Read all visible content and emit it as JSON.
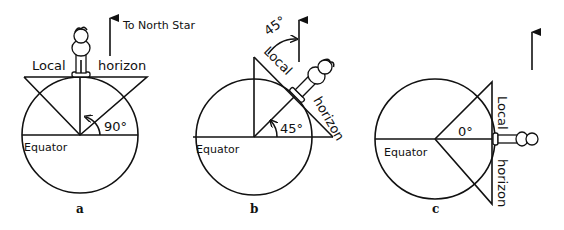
{
  "panels": [
    {
      "id": "a",
      "caption": "a",
      "local_label": "Local",
      "horizon_label": "horizon",
      "equator_label": "Equator",
      "angle_label": "90°",
      "arrow_label": "To North Star"
    },
    {
      "id": "b",
      "caption": "b",
      "local_label": "Local",
      "horizon_label": "horizon",
      "equator_label": "Equator",
      "angle_label": "45°",
      "sky_angle_label": "45°"
    },
    {
      "id": "c",
      "caption": "c",
      "local_label": "Local",
      "horizon_label": "horizon",
      "equator_label": "Equator",
      "angle_label": "0°"
    }
  ],
  "colors": {
    "ink": "#111111",
    "background": "#ffffff"
  }
}
